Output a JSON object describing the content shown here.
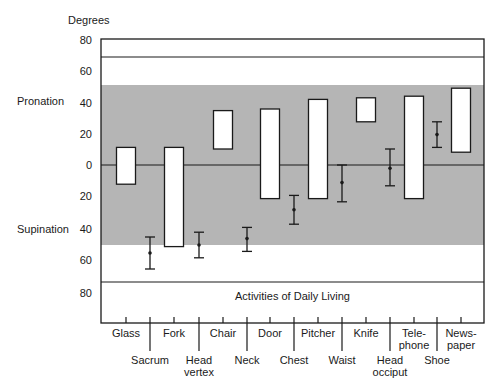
{
  "chart_data": {
    "type": "bar",
    "title": "",
    "ylabel": "Degrees",
    "xlabel": "Activities of Daily Living",
    "side_labels": {
      "upper": "Pronation",
      "lower": "Supination"
    },
    "yticks_upper": [
      "80",
      "60",
      "40",
      "20"
    ],
    "yticks_zero": "0",
    "yticks_lower": [
      "20",
      "40",
      "60",
      "80"
    ],
    "ylim": [
      -80,
      80
    ],
    "y_convention": "positive = pronation, negative = supination",
    "shaded_band": {
      "from": -50,
      "to": 50,
      "color": "#b5b5b5"
    },
    "reference_line_upper": 70,
    "reference_line_lower": -73,
    "range_bars": {
      "description": "Floating bars showing forearm rotation range (min to max) required",
      "categories": [
        "Glass",
        "Fork",
        "Chair",
        "Door",
        "Pitcher",
        "Knife",
        "Telephone",
        "Newspaper"
      ],
      "display_labels": [
        "Glass",
        "Fork",
        "Chair",
        "Door",
        "Pitcher",
        "Knife",
        "Tele-|phone",
        "News-|paper"
      ],
      "min": [
        -12,
        -51,
        10,
        -21,
        -21,
        27,
        -21,
        8
      ],
      "max": [
        11,
        11,
        34,
        35,
        41,
        42,
        43,
        48
      ]
    },
    "error_bars": {
      "description": "Mean with range whiskers",
      "categories": [
        "Sacrum",
        "Head vertex",
        "Neck",
        "Chest",
        "Waist",
        "Head occiput",
        "Shoe"
      ],
      "display_labels": [
        "Sacrum",
        "Head|vertex",
        "Neck",
        "Chest",
        "Waist",
        "Head|occiput",
        "Shoe"
      ],
      "mean": [
        -55,
        -50,
        -46,
        -28,
        -11,
        -2,
        19
      ],
      "low": [
        -65,
        -58,
        -54,
        -37,
        -23,
        -13,
        11
      ],
      "high": [
        -45,
        -42,
        -39,
        -19,
        0,
        10,
        27
      ]
    },
    "grid": false,
    "legend": null
  }
}
